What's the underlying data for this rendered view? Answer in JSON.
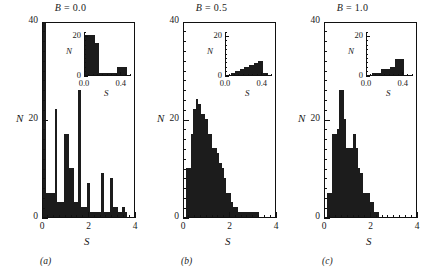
{
  "figure": {
    "panels": [
      {
        "id": "a",
        "caption": "(a)",
        "title_var": "B",
        "title_eq": " = ",
        "title_val": "0.0",
        "title": "B = 0.0",
        "xlabel": "S",
        "ylabel": "N",
        "xticks": [
          "0",
          "2",
          "4"
        ],
        "yticks": [
          "0",
          "20",
          "40"
        ],
        "inset": {
          "xlabel": "S",
          "ylabel": "N",
          "xticks": [
            "0.0",
            "0.4"
          ],
          "yticks": [
            "0",
            "20"
          ]
        }
      },
      {
        "id": "b",
        "caption": "(b)",
        "title_var": "B",
        "title_eq": " = ",
        "title_val": "0.5",
        "title": "B = 0.5",
        "xlabel": "S",
        "ylabel": "N",
        "xticks": [
          "0",
          "2",
          "4"
        ],
        "yticks": [
          "0",
          "20",
          "40"
        ],
        "inset": {
          "xlabel": "S",
          "ylabel": "N",
          "xticks": [
            "0.0",
            "0.4"
          ],
          "yticks": [
            "0",
            "20"
          ]
        }
      },
      {
        "id": "c",
        "caption": "(c)",
        "title_var": "B",
        "title_eq": " = ",
        "title_val": "1.0",
        "title": "B = 1.0",
        "xlabel": "S",
        "ylabel": "N",
        "xticks": [
          "0",
          "2",
          "4"
        ],
        "yticks": [
          "0",
          "20",
          "40"
        ],
        "inset": {
          "xlabel": "S",
          "ylabel": "N",
          "xticks": [
            "0.0",
            "0.4"
          ],
          "yticks": [
            "0",
            "20"
          ]
        }
      }
    ]
  },
  "chart_data": [
    {
      "type": "bar",
      "title": "B = 0.0",
      "xlabel": "S",
      "ylabel": "N",
      "xlim": [
        0,
        4
      ],
      "ylim": [
        0,
        40
      ],
      "xticks": [
        0,
        2,
        4
      ],
      "yticks": [
        0,
        20,
        40
      ],
      "minor_ytick_step": 2,
      "minor_xtick_step": 0.25,
      "bin_width": 0.1,
      "grid": false,
      "legend": false,
      "bin_starts": [
        0.0,
        0.1,
        0.2,
        0.3,
        0.4,
        0.5,
        0.6,
        0.7,
        0.8,
        0.9,
        1.0,
        1.1,
        1.2,
        1.3,
        1.4,
        1.5,
        1.6,
        1.7,
        1.8,
        1.9,
        2.0,
        2.1,
        2.2,
        2.3,
        2.4,
        2.5,
        2.6,
        2.7,
        2.8,
        2.9,
        3.0,
        3.1,
        3.2,
        3.3,
        3.4,
        3.5,
        3.6,
        3.7,
        3.8,
        3.9
      ],
      "values": [
        40,
        5,
        5,
        5,
        5,
        22,
        3,
        3,
        3,
        17,
        17,
        10,
        10,
        3,
        3,
        26,
        2,
        2,
        2,
        7,
        1,
        1,
        1,
        1,
        1,
        9,
        1,
        1,
        1,
        8,
        2,
        2,
        1,
        1,
        2,
        1,
        0,
        0,
        0,
        0
      ],
      "inset": {
        "type": "bar",
        "xlabel": "S",
        "ylabel": "N",
        "xlim": [
          0.0,
          0.5
        ],
        "ylim": [
          0,
          22
        ],
        "xticks": [
          0.0,
          0.4
        ],
        "yticks": [
          0,
          20
        ],
        "bin_width": 0.05,
        "bin_starts": [
          0.0,
          0.05,
          0.1,
          0.15,
          0.2,
          0.25,
          0.3,
          0.35,
          0.4,
          0.45
        ],
        "values": [
          20,
          20,
          16,
          1,
          1,
          1,
          1,
          4,
          4,
          0
        ]
      }
    },
    {
      "type": "bar",
      "title": "B = 0.5",
      "xlabel": "S",
      "ylabel": "N",
      "xlim": [
        0,
        4
      ],
      "ylim": [
        0,
        40
      ],
      "xticks": [
        0,
        2,
        4
      ],
      "yticks": [
        0,
        20,
        40
      ],
      "minor_ytick_step": 2,
      "minor_xtick_step": 0.25,
      "bin_width": 0.1,
      "grid": false,
      "legend": false,
      "bin_starts": [
        0.0,
        0.1,
        0.2,
        0.3,
        0.4,
        0.5,
        0.6,
        0.7,
        0.8,
        0.9,
        1.0,
        1.1,
        1.2,
        1.3,
        1.4,
        1.5,
        1.6,
        1.7,
        1.8,
        1.9,
        2.0,
        2.1,
        2.2,
        2.3,
        2.4,
        2.5,
        2.6,
        2.7,
        2.8,
        2.9,
        3.0,
        3.1,
        3.2,
        3.3,
        3.4,
        3.5,
        3.6,
        3.7,
        3.8,
        3.9
      ],
      "values": [
        0,
        10,
        10,
        17,
        22,
        24,
        23,
        21,
        21,
        20,
        17,
        17,
        14,
        14,
        13,
        11,
        10,
        8,
        5,
        5,
        3,
        2,
        2,
        1,
        1,
        1,
        1,
        1,
        1,
        1,
        1,
        1,
        0,
        0,
        0,
        0,
        0,
        0,
        0,
        0
      ],
      "inset": {
        "type": "bar",
        "xlabel": "S",
        "ylabel": "N",
        "xlim": [
          0.0,
          0.5
        ],
        "ylim": [
          0,
          22
        ],
        "xticks": [
          0.0,
          0.4
        ],
        "yticks": [
          0,
          20
        ],
        "bin_width": 0.05,
        "bin_starts": [
          0.0,
          0.05,
          0.1,
          0.15,
          0.2,
          0.25,
          0.3,
          0.35,
          0.4,
          0.45
        ],
        "values": [
          0,
          1,
          2,
          3,
          4,
          5,
          6,
          7,
          1,
          0
        ]
      }
    },
    {
      "type": "bar",
      "title": "B = 1.0",
      "xlabel": "S",
      "ylabel": "N",
      "xlim": [
        0,
        4
      ],
      "ylim": [
        0,
        40
      ],
      "xticks": [
        0,
        2,
        4
      ],
      "yticks": [
        0,
        20,
        40
      ],
      "minor_ytick_step": 2,
      "minor_xtick_step": 0.25,
      "bin_width": 0.1,
      "grid": false,
      "legend": false,
      "bin_starts": [
        0.0,
        0.1,
        0.2,
        0.3,
        0.4,
        0.5,
        0.6,
        0.7,
        0.8,
        0.9,
        1.0,
        1.1,
        1.2,
        1.3,
        1.4,
        1.5,
        1.6,
        1.7,
        1.8,
        1.9,
        2.0,
        2.1,
        2.2,
        2.3,
        2.4,
        2.5,
        2.6,
        2.7,
        2.8,
        2.9,
        3.0,
        3.1,
        3.2,
        3.3,
        3.4,
        3.5,
        3.6,
        3.7,
        3.8,
        3.9
      ],
      "values": [
        0,
        5,
        5,
        17,
        17,
        18,
        26,
        26,
        20,
        14,
        14,
        14,
        17,
        14,
        10,
        9,
        5,
        5,
        5,
        3,
        3,
        1,
        1,
        0,
        0,
        0,
        0,
        0,
        0,
        0,
        0,
        0,
        0,
        0,
        0,
        0,
        0,
        0,
        0,
        0
      ],
      "inset": {
        "type": "bar",
        "xlabel": "S",
        "ylabel": "N",
        "xlim": [
          0.0,
          0.5
        ],
        "ylim": [
          0,
          22
        ],
        "xticks": [
          0.0,
          0.4
        ],
        "yticks": [
          0,
          20
        ],
        "bin_width": 0.05,
        "bin_starts": [
          0.0,
          0.05,
          0.1,
          0.15,
          0.2,
          0.25,
          0.3,
          0.35,
          0.4,
          0.45
        ],
        "values": [
          0,
          1,
          1,
          3,
          3,
          4,
          8,
          8,
          0,
          0
        ]
      }
    }
  ]
}
